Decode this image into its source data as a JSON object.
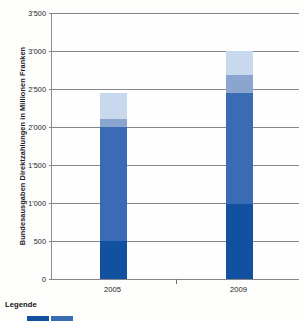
{
  "chart_data": {
    "type": "bar",
    "title": "",
    "subtitle": "",
    "xlabel": "",
    "ylabel": "Bundesausgaben Direktzahlungen in Millionen Franken",
    "stacked": true,
    "grid": true,
    "legend_position": "bottom-left",
    "ylim": [
      0,
      3500
    ],
    "yticks": [
      0,
      500,
      1000,
      1500,
      2000,
      2500,
      3000,
      3500
    ],
    "ytick_labels": [
      "0",
      "500",
      "1'000",
      "1'500",
      "2'000",
      "2'500",
      "3'000",
      "3'500"
    ],
    "categories": [
      "2005",
      "2009"
    ],
    "series": [
      {
        "name": "segment-1",
        "color": "#12519f",
        "values": [
          500,
          990
        ]
      },
      {
        "name": "segment-2",
        "color": "#3a6bb5",
        "values": [
          1500,
          1460
        ]
      },
      {
        "name": "segment-3",
        "color": "#8aa5d0",
        "values": [
          100,
          230
        ]
      },
      {
        "name": "segment-4",
        "color": "#c9d9ed",
        "values": [
          350,
          320
        ]
      }
    ],
    "totals": [
      2450,
      3000
    ]
  },
  "axis": {
    "y_title": "Bundesausgaben Direktzahlungen in Millionen Franken",
    "ticks": [
      {
        "value": 3500,
        "label": "3'500"
      },
      {
        "value": 3000,
        "label": "3'000"
      },
      {
        "value": 2500,
        "label": "2'500"
      },
      {
        "value": 2000,
        "label": "2'000"
      },
      {
        "value": 1500,
        "label": "1'500"
      },
      {
        "value": 1000,
        "label": "1'000"
      },
      {
        "value": 500,
        "label": "500"
      },
      {
        "value": 0,
        "label": "0"
      }
    ],
    "x_categories": [
      {
        "label": "2005"
      },
      {
        "label": "2009"
      }
    ]
  },
  "legend": {
    "title": "Legende",
    "swatches": [
      "#12519f",
      "#3a6bb5"
    ]
  },
  "colors": {
    "darkest": "#12519f",
    "medium": "#3a6bb5",
    "light": "#8aa5d0",
    "lightest": "#c9d9ed",
    "gridline": "#86868a",
    "text": "#1c1c1c"
  }
}
